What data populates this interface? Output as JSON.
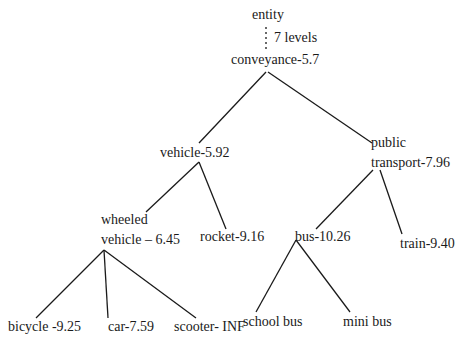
{
  "diagram": {
    "type": "taxonomy-tree",
    "root_label": "entity",
    "gap_label": "7 levels",
    "nodes": {
      "entity": "entity",
      "conveyance": "conveyance-5.7",
      "vehicle": "vehicle-5.92",
      "public_transport_line1": "public",
      "public_transport_line2": "transport-7.96",
      "wheeled_vehicle_line1": "wheeled",
      "wheeled_vehicle_line2": "vehicle – 6.45",
      "rocket": "rocket-9.16",
      "bus": "bus-10.26",
      "train": "train-9.40",
      "bicycle": "bicycle -9.25",
      "car": "car-7.59",
      "scooter": "scooter- INF",
      "school_bus": "school bus",
      "mini_bus": "mini bus"
    },
    "edges": [
      {
        "from": "entity",
        "to": "conveyance",
        "style": "dotted"
      },
      {
        "from": "conveyance",
        "to": "vehicle"
      },
      {
        "from": "conveyance",
        "to": "public transport"
      },
      {
        "from": "vehicle",
        "to": "wheeled vehicle"
      },
      {
        "from": "vehicle",
        "to": "rocket"
      },
      {
        "from": "public transport",
        "to": "bus"
      },
      {
        "from": "public transport",
        "to": "train"
      },
      {
        "from": "wheeled vehicle",
        "to": "bicycle"
      },
      {
        "from": "wheeled vehicle",
        "to": "car"
      },
      {
        "from": "wheeled vehicle",
        "to": "scooter"
      },
      {
        "from": "bus",
        "to": "school bus"
      },
      {
        "from": "bus",
        "to": "mini bus"
      }
    ],
    "colors": {
      "background": "#ffffff",
      "line": "#1a1a1a",
      "text": "#1a1a1a"
    }
  }
}
